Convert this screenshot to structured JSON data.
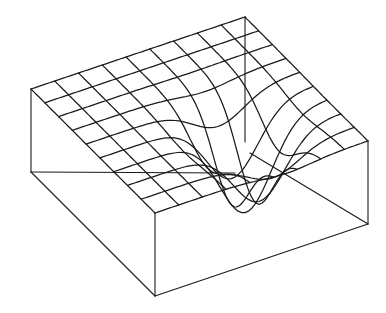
{
  "diagram": {
    "type": "3d-wireframe-surface",
    "grid": {
      "cells_u": 9,
      "cells_v": 9
    },
    "surface": {
      "function": "gaussian-well",
      "well_center_u": 0.62,
      "well_center_v": 0.66,
      "well_width_u": 0.17,
      "well_width_v": 0.2,
      "well_depth": 0.9
    },
    "colors": {
      "line": "#1a1a1a",
      "background": "#ffffff"
    }
  }
}
